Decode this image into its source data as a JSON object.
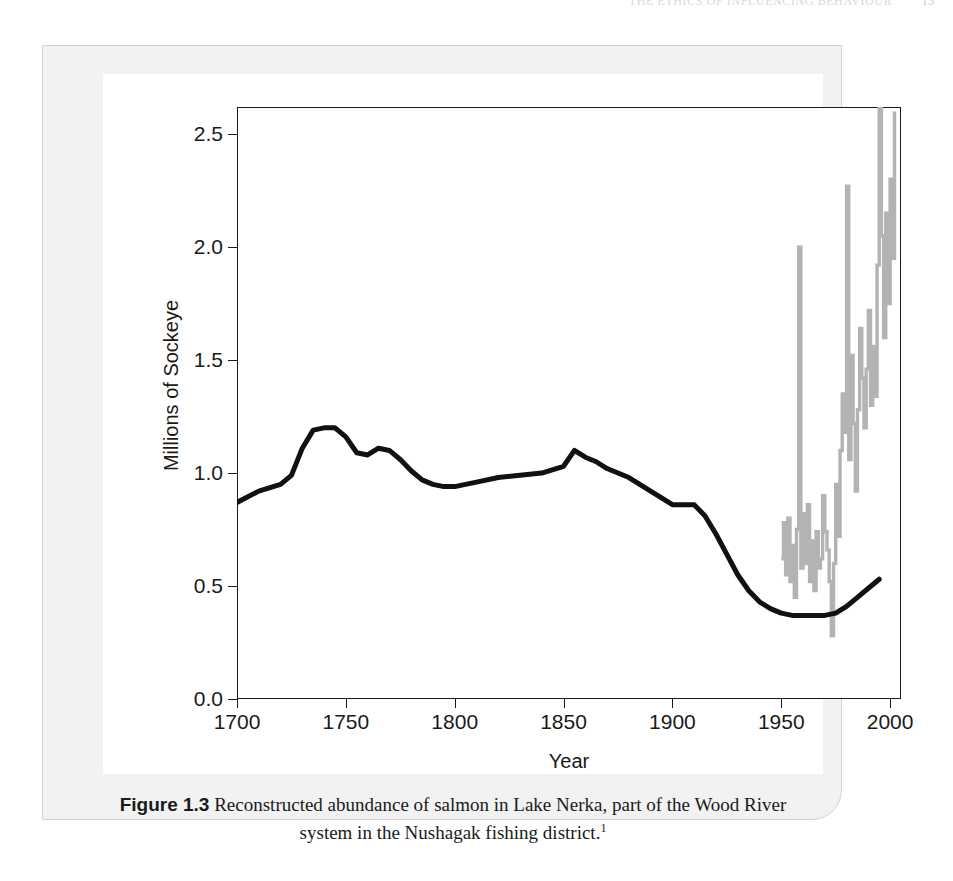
{
  "running_head": {
    "text": "THE ETHICS OF INFLUENCING BEHAVIOUR",
    "page_number": "13"
  },
  "caption": {
    "figure_label": "Figure 1.3",
    "text": "Reconstructed abundance of salmon in Lake Nerka, part of the Wood River system in the Nushagak fishing district.",
    "footnote_marker": "1"
  },
  "colors": {
    "reconstructed_line": "#111111",
    "observed_series": "#b3b3b3",
    "axis": "#1a1a1a",
    "panel_background": "#f2f2f2",
    "plot_background": "#ffffff"
  },
  "chart_data": {
    "type": "line",
    "title": "",
    "xlabel": "Year",
    "ylabel": "Millions of Sockeye",
    "xlim": [
      1700,
      2005
    ],
    "ylim": [
      0.0,
      2.62
    ],
    "xticks": [
      1700,
      1750,
      1800,
      1850,
      1900,
      1950,
      2000
    ],
    "xtick_labels": [
      "1700",
      "1750",
      "1800",
      "1850",
      "1900",
      "1950",
      "2000"
    ],
    "yticks": [
      0.0,
      0.5,
      1.0,
      1.5,
      2.0,
      2.5
    ],
    "ytick_labels": [
      "0.0",
      "0.5",
      "1.0",
      "1.5",
      "2.0",
      "2.5"
    ],
    "grid": false,
    "legend": "none",
    "series": [
      {
        "name": "Reconstructed abundance (smoothed)",
        "color": "#111111",
        "style": "thick-line",
        "x": [
          1700,
          1710,
          1720,
          1725,
          1730,
          1735,
          1740,
          1745,
          1750,
          1755,
          1760,
          1765,
          1770,
          1775,
          1780,
          1785,
          1790,
          1795,
          1800,
          1810,
          1820,
          1830,
          1840,
          1850,
          1855,
          1860,
          1865,
          1870,
          1875,
          1880,
          1885,
          1890,
          1895,
          1900,
          1905,
          1910,
          1915,
          1920,
          1925,
          1930,
          1935,
          1940,
          1945,
          1950,
          1955,
          1960,
          1965,
          1970,
          1975,
          1980,
          1985,
          1990,
          1995
        ],
        "y": [
          0.87,
          0.92,
          0.95,
          0.99,
          1.11,
          1.19,
          1.2,
          1.2,
          1.16,
          1.09,
          1.08,
          1.11,
          1.1,
          1.06,
          1.01,
          0.97,
          0.95,
          0.94,
          0.94,
          0.96,
          0.98,
          0.99,
          1.0,
          1.03,
          1.1,
          1.07,
          1.05,
          1.02,
          1.0,
          0.98,
          0.95,
          0.92,
          0.89,
          0.86,
          0.86,
          0.86,
          0.81,
          0.73,
          0.64,
          0.55,
          0.48,
          0.43,
          0.4,
          0.38,
          0.37,
          0.37,
          0.37,
          0.37,
          0.38,
          0.41,
          0.45,
          0.49,
          0.53
        ]
      },
      {
        "name": "Observed annual run (modern record)",
        "color": "#b3b3b3",
        "style": "spiky-line",
        "x": [
          1950,
          1951,
          1952,
          1953,
          1954,
          1955,
          1956,
          1957,
          1958,
          1959,
          1960,
          1961,
          1962,
          1963,
          1964,
          1965,
          1966,
          1967,
          1968,
          1969,
          1970,
          1971,
          1972,
          1973,
          1974,
          1975,
          1976,
          1977,
          1978,
          1979,
          1980,
          1981,
          1982,
          1983,
          1984,
          1985,
          1986,
          1987,
          1988,
          1989,
          1990,
          1991,
          1992,
          1993,
          1994,
          1995,
          1996,
          1997,
          1998,
          1999,
          2000,
          2001,
          2002
        ],
        "y": [
          0.62,
          0.78,
          0.55,
          0.8,
          0.52,
          0.68,
          0.45,
          0.75,
          2.0,
          0.58,
          0.82,
          0.6,
          0.86,
          0.52,
          0.7,
          0.48,
          0.74,
          0.58,
          0.62,
          0.9,
          0.74,
          0.66,
          0.52,
          0.28,
          0.6,
          0.95,
          0.72,
          1.1,
          1.35,
          1.18,
          2.27,
          1.06,
          1.52,
          1.22,
          0.92,
          1.28,
          1.64,
          1.42,
          1.2,
          1.46,
          1.72,
          1.3,
          1.56,
          1.34,
          1.92,
          2.7,
          2.05,
          1.6,
          2.15,
          1.75,
          2.3,
          1.95,
          2.6
        ]
      }
    ]
  }
}
